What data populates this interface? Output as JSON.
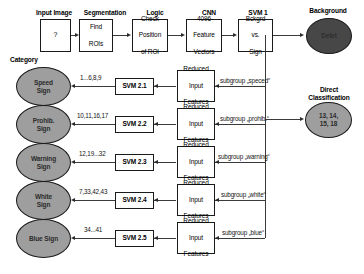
{
  "diagram": {
    "colors": {
      "category_fill": "#9e9e9e",
      "background_node_fill": "#474747",
      "direct_node_fill": "#9e9e9e",
      "line": "#3a3a3a",
      "box_border": "#1a1a1a"
    }
  },
  "pipeline": {
    "headers": {
      "input_image": "Input Image",
      "segmentation": "Segmentation",
      "logic": "Logic",
      "cnn": "CNN",
      "svm1": "SVM 1",
      "background": "Background",
      "category": "Category",
      "direct_classification": "Direct\nClassification"
    },
    "stages": [
      {
        "name": "input-image",
        "lines": [
          "?"
        ]
      },
      {
        "name": "segmentation",
        "lines": [
          "Find",
          "ROIs"
        ]
      },
      {
        "name": "logic",
        "lines": [
          "Check",
          "Position",
          "of ROI"
        ]
      },
      {
        "name": "cnn",
        "lines": [
          "4096",
          "Feature",
          "Vectors"
        ]
      },
      {
        "name": "svm1",
        "lines": [
          "Bckgrd",
          "vs.",
          "Sign"
        ]
      }
    ],
    "background_node": {
      "label": "Delet"
    },
    "direct_node": {
      "lines": [
        "13, 14,",
        "15, 18"
      ]
    }
  },
  "branches": [
    {
      "category": "Speed\nSign",
      "category_line1": "Speed",
      "category_line2": "Sign",
      "classes": "1...6,8,9",
      "svm": "SVM 2.1",
      "features": "Reduced\nInput\nFeatures",
      "subgroup": "subgroup „speced“"
    },
    {
      "category": "Prohib.\nSign",
      "category_line1": "Prohib.",
      "category_line2": "Sign",
      "classes": "10,11,16,17",
      "svm": "SVM 2.2",
      "features": "Reduced\nInput\nFeatures",
      "subgroup": "subgroup „prohib.“"
    },
    {
      "category": "Warning\nSign",
      "category_line1": "Warning",
      "category_line2": "Sign",
      "classes": "12,19...32",
      "svm": "SVM 2.3",
      "features": "Reduced\nInput\nFeatures",
      "subgroup": "subgroup „warning“"
    },
    {
      "category": "White\nSign",
      "category_line1": "White",
      "category_line2": "Sign",
      "classes": "7,33,42,43",
      "svm": "SVM 2.4",
      "features": "Reduced\nInput\nFeatures",
      "subgroup": "subgroup „white“"
    },
    {
      "category": "Blue Sign",
      "category_line1": "Blue Sign",
      "category_line2": "",
      "classes": "34...41",
      "svm": "SVM 2.5",
      "features": "Reduced\nInput\nFeatures",
      "subgroup": "subgroup „blue“"
    }
  ],
  "feature_box_lines": [
    "Reduced",
    "Input",
    "Features"
  ]
}
